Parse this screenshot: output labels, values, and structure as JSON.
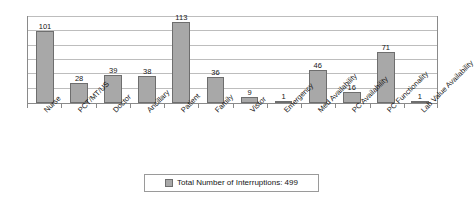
{
  "chart_data": {
    "type": "bar",
    "title": "",
    "subtitle": "",
    "xlabel": "",
    "ylabel": "",
    "ylim": [
      0,
      120
    ],
    "grid": true,
    "gridline_values": [
      20,
      40,
      60,
      80,
      100,
      120
    ],
    "axis_tick_labels_visible": false,
    "bar_orientation": "vertical",
    "data_labels_shown": true,
    "categories": [
      "Nurse",
      "PCT/MT/US",
      "Doctor",
      "Ancillary",
      "Patient",
      "Family",
      "Vistor",
      "Emergency",
      "Med Availability",
      "PC Availability",
      "PC Functionality",
      "Lab Value Availability"
    ],
    "values": [
      101,
      28,
      39,
      38,
      113,
      36,
      9,
      1,
      46,
      16,
      71,
      1
    ],
    "series": [
      {
        "name": "Total Number of Interruptions: 499",
        "values": [
          101,
          28,
          39,
          38,
          113,
          36,
          9,
          1,
          46,
          16,
          71,
          1
        ],
        "color": "#a8a8a8"
      }
    ],
    "legend": {
      "position": "bottom",
      "entries": [
        {
          "label": "Total Number of Interruptions: 499",
          "color": "#a8a8a8"
        }
      ]
    },
    "total": 499,
    "colors": {
      "bar_fill": "#a8a8a8",
      "bar_stroke": "#6e6e6e",
      "gridline": "#bdbdbd",
      "frame": "#8a8a8a",
      "text": "#161616",
      "background": "#ffffff"
    }
  }
}
